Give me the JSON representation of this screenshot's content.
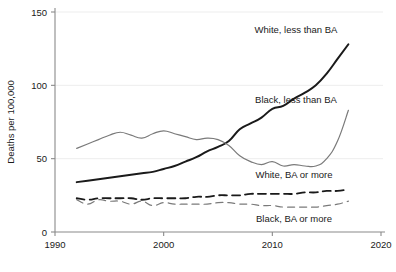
{
  "chart_data": {
    "type": "line",
    "title": "",
    "xlabel": "",
    "ylabel": "Deaths per 100,000",
    "xlim": [
      1990,
      2020
    ],
    "ylim": [
      0,
      150
    ],
    "xticks": [
      1990,
      2000,
      2010,
      2020
    ],
    "xtick_labels": [
      "1990",
      "2000",
      "2010",
      "2020"
    ],
    "yticks": [
      0,
      50,
      100,
      150
    ],
    "ytick_labels": [
      "0",
      "50",
      "100",
      "150"
    ],
    "grid": "horizontal-faint",
    "legend_position": "inline-annotations",
    "x": [
      1992,
      1993,
      1994,
      1995,
      1996,
      1997,
      1998,
      1999,
      2000,
      2001,
      2002,
      2003,
      2004,
      2005,
      2006,
      2007,
      2008,
      2009,
      2010,
      2011,
      2012,
      2013,
      2014,
      2015,
      2016,
      2017
    ],
    "series": [
      {
        "name": "White, less than BA",
        "style": "solid",
        "color": "#1a1a1a",
        "width": 2.0,
        "label_text": "White, less than BA",
        "values": [
          34,
          35,
          36,
          37,
          38,
          39,
          40,
          41,
          43,
          45,
          48,
          51,
          55,
          58,
          62,
          70,
          74,
          78,
          84,
          86,
          91,
          95,
          100,
          108,
          118,
          128
        ]
      },
      {
        "name": "Black, less than BA",
        "style": "solid",
        "color": "#7a7a7a",
        "width": 1.2,
        "label_text": "Black, less than BA",
        "values": [
          57,
          60,
          63,
          66,
          68,
          66,
          64,
          67,
          69,
          67,
          65,
          63,
          64,
          63,
          59,
          52,
          48,
          46,
          48,
          45,
          46,
          45,
          45,
          50,
          62,
          83
        ]
      },
      {
        "name": "White, BA or more",
        "style": "dashed",
        "color": "#1a1a1a",
        "width": 1.8,
        "label_text": "White, BA or more",
        "values": [
          23,
          22,
          23,
          23,
          23,
          23,
          22,
          23,
          23,
          23,
          23,
          24,
          24,
          25,
          25,
          25,
          26,
          26,
          26,
          26,
          26,
          27,
          27,
          28,
          28,
          29
        ]
      },
      {
        "name": "Black, BA or more",
        "style": "dashed",
        "color": "#7a7a7a",
        "width": 1.2,
        "label_text": "Black, BA or more",
        "values": [
          22,
          19,
          22,
          21,
          21,
          19,
          21,
          18,
          20,
          19,
          19,
          19,
          19,
          20,
          20,
          19,
          19,
          18,
          18,
          17,
          17,
          17,
          17,
          18,
          19,
          21
        ]
      }
    ],
    "annotations": [
      {
        "text": "White, less than BA",
        "x_px": 296,
        "y_px": 33,
        "anchor": "middle"
      },
      {
        "text": "Black, less than BA",
        "x_px": 296,
        "y_px": 103,
        "anchor": "middle"
      },
      {
        "text": "White, BA or more",
        "x_px": 294,
        "y_px": 178,
        "anchor": "middle"
      },
      {
        "text": "Black, BA or more",
        "x_px": 294,
        "y_px": 222,
        "anchor": "middle"
      }
    ]
  }
}
